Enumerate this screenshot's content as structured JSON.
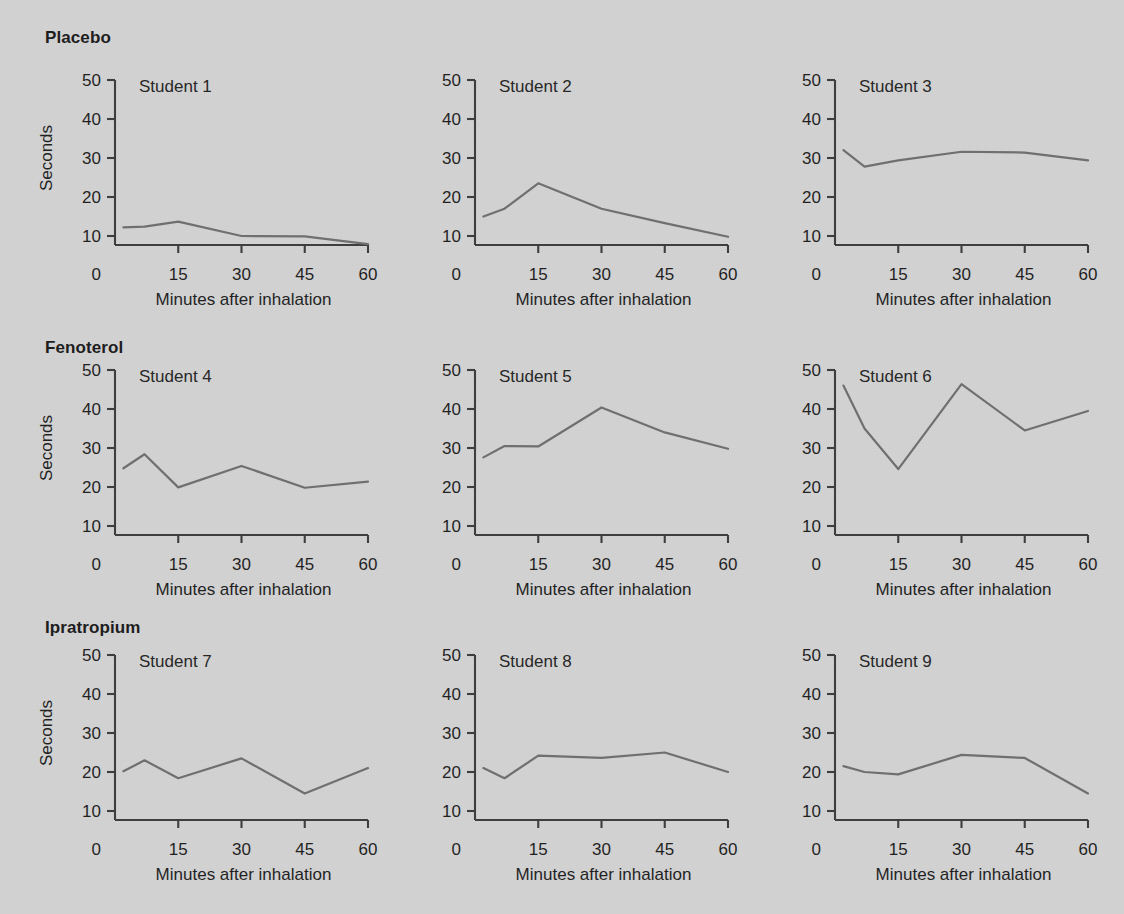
{
  "figure": {
    "background_color": "#d2d2d2",
    "line_color": "#6f6f6f",
    "axis_color": "#3d3d3d",
    "groups": [
      {
        "id": "placebo",
        "label": "Placebo"
      },
      {
        "id": "fenoterol",
        "label": "Fenoterol"
      },
      {
        "id": "ipratropium",
        "label": "Ipratropium"
      }
    ]
  },
  "axes": {
    "ylabel": "Seconds",
    "xlabel": "Minutes after inhalation",
    "y_ticks": [
      "50",
      "40",
      "30",
      "20",
      "10"
    ],
    "y_zero_label": "0",
    "x_ticks": [
      "15",
      "30",
      "45",
      "60"
    ],
    "x_zero_label": "0",
    "ylim": [
      0,
      50
    ],
    "xlim": [
      0,
      60
    ]
  },
  "panels": [
    {
      "title": "Student 1",
      "group": "Placebo"
    },
    {
      "title": "Student 2",
      "group": "Placebo"
    },
    {
      "title": "Student 3",
      "group": "Placebo"
    },
    {
      "title": "Student 4",
      "group": "Fenoterol"
    },
    {
      "title": "Student 5",
      "group": "Fenoterol"
    },
    {
      "title": "Student 6",
      "group": "Fenoterol"
    },
    {
      "title": "Student 7",
      "group": "Ipratropium"
    },
    {
      "title": "Student 8",
      "group": "Ipratropium"
    },
    {
      "title": "Student 9",
      "group": "Ipratropium"
    }
  ],
  "chart_data": {
    "type": "line",
    "title": "",
    "xlabel": "Minutes after inhalation",
    "ylabel": "Seconds",
    "xlim": [
      0,
      60
    ],
    "ylim": [
      0,
      50
    ],
    "x_ticks": [
      0,
      15,
      30,
      45,
      60
    ],
    "y_ticks": [
      0,
      10,
      20,
      30,
      40,
      50
    ],
    "grid": false,
    "legend": "none",
    "layout": "3 rows (treatment groups) x 3 columns (students) small multiples",
    "x": [
      2,
      7,
      15,
      30,
      45,
      60
    ],
    "series": [
      {
        "name": "Student 1",
        "group": "Placebo",
        "values": [
          12.2,
          12.4,
          13.7,
          10.0,
          9.9,
          7.9
        ]
      },
      {
        "name": "Student 2",
        "group": "Placebo",
        "values": [
          15.0,
          17.0,
          23.5,
          17.0,
          13.3,
          9.8
        ]
      },
      {
        "name": "Student 3",
        "group": "Placebo",
        "values": [
          32.0,
          27.8,
          29.4,
          31.6,
          31.4,
          29.4
        ]
      },
      {
        "name": "Student 4",
        "group": "Fenoterol",
        "values": [
          24.8,
          28.4,
          19.9,
          25.4,
          19.8,
          21.4
        ]
      },
      {
        "name": "Student 5",
        "group": "Fenoterol",
        "values": [
          27.6,
          30.5,
          30.4,
          40.4,
          34.0,
          29.8
        ]
      },
      {
        "name": "Student 6",
        "group": "Fenoterol",
        "values": [
          46.0,
          35.0,
          24.6,
          46.4,
          34.5,
          39.5
        ]
      },
      {
        "name": "Student 7",
        "group": "Ipratropium",
        "values": [
          20.2,
          23.0,
          18.4,
          23.5,
          14.5,
          21.0
        ]
      },
      {
        "name": "Student 8",
        "group": "Ipratropium",
        "values": [
          21.0,
          18.4,
          24.2,
          23.6,
          25.0,
          20.0
        ]
      },
      {
        "name": "Student 9",
        "group": "Ipratropium",
        "values": [
          21.5,
          20.0,
          19.4,
          24.4,
          23.6,
          14.5
        ]
      }
    ]
  }
}
